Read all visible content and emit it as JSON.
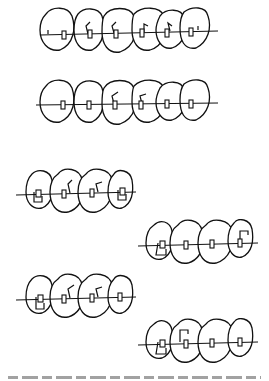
{
  "figure": {
    "type": "orthodontic-appliance-line-drawings",
    "panels": [
      {
        "id": "upper-arch-6-teeth-a",
        "teeth": 6,
        "bends": [
          "tooth2",
          "tooth3",
          "tooth4",
          "tooth5"
        ],
        "wire": "continuous"
      },
      {
        "id": "upper-arch-6-teeth-b",
        "teeth": 6,
        "bends": [
          "tooth3",
          "tooth4"
        ],
        "wire": "continuous"
      },
      {
        "id": "segment-left-a",
        "teeth": 4,
        "loops": [
          "tooth1",
          "tooth4"
        ],
        "bends": [
          "tooth2",
          "tooth3"
        ]
      },
      {
        "id": "segment-right-a",
        "teeth": 4,
        "loops": [
          "tooth1",
          "tooth4"
        ]
      },
      {
        "id": "segment-left-b",
        "teeth": 4,
        "loops": [
          "tooth1"
        ],
        "bends": [
          "tooth2",
          "tooth3"
        ]
      },
      {
        "id": "segment-right-b",
        "teeth": 4,
        "loops": [
          "tooth1",
          "tooth2"
        ]
      }
    ],
    "colors": {
      "line": "#111111",
      "background": "#ffffff"
    }
  }
}
